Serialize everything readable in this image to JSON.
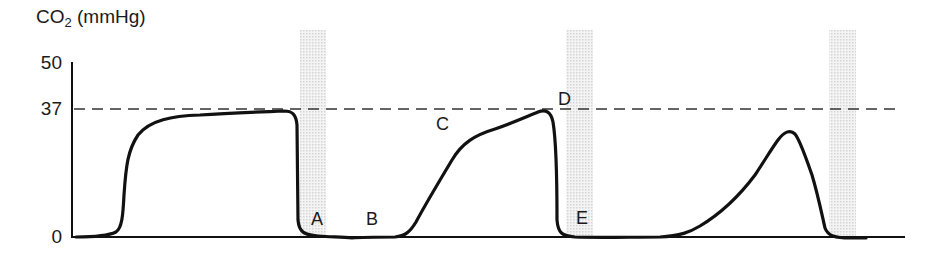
{
  "diagram": {
    "y_axis": {
      "label_prefix": "CO",
      "label_sub": "2",
      "label_suffix": " (mmHg)",
      "ticks": [
        {
          "label": "50",
          "value": 50
        },
        {
          "label": "37",
          "value": 37
        },
        {
          "label": "0",
          "value": 0
        }
      ]
    },
    "reference_line": {
      "value": 37,
      "style": "dashed"
    },
    "point_labels": [
      {
        "id": "A",
        "label": "A"
      },
      {
        "id": "B",
        "label": "B"
      },
      {
        "id": "C",
        "label": "C"
      },
      {
        "id": "D",
        "label": "D"
      },
      {
        "id": "E",
        "label": "E"
      }
    ],
    "shaded_bands": 3,
    "colors": {
      "line": "#111111",
      "dashed": "#333333",
      "band": "#d9d9d9",
      "text": "#1a1a1a"
    }
  }
}
